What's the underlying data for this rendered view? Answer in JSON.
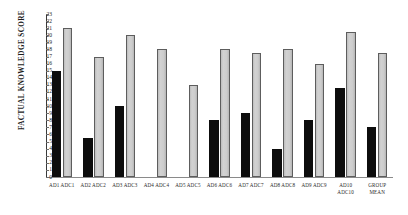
{
  "chart_data": {
    "type": "bar",
    "title": "",
    "subtitle": "",
    "xlabel": "",
    "ylabel": "FACTUAL KNOWLEDGE SCORE",
    "ylim": [
      0,
      23
    ],
    "ytick_step": 1,
    "yticks": [
      0,
      1,
      2,
      3,
      4,
      5,
      6,
      7,
      8,
      9,
      10,
      11,
      12,
      13,
      14,
      15,
      16,
      17,
      18,
      19,
      20,
      21,
      22,
      23
    ],
    "grid": false,
    "legend": "none",
    "orientation": "vertical",
    "categories": [
      "AD1 ADC1",
      "AD2 ADC2",
      "AD3 ADC3",
      "AD4 ADC4",
      "AD5 ADC5",
      "AD6 ADC6",
      "AD7 ADC7",
      "AD8 ADC8",
      "AD9 ADC9",
      "AD10\nADC10",
      "GROUP\nMEAN"
    ],
    "series": [
      {
        "name": "AD",
        "color": "#0d0d0d",
        "values": [
          15,
          5.5,
          10,
          0,
          0,
          8,
          9,
          4,
          8,
          12.5,
          7
        ]
      },
      {
        "name": "ADC",
        "color": "#c9c9c9",
        "values": [
          21,
          17,
          20,
          18,
          13,
          18,
          17.5,
          18,
          16,
          20.5,
          17.5
        ]
      }
    ]
  }
}
